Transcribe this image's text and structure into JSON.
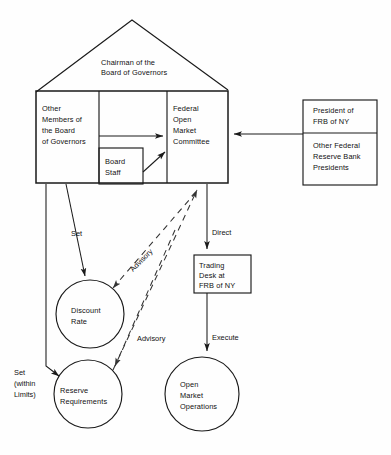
{
  "diagram": {
    "colors": {
      "stroke": "#1a1a1a",
      "dashed_stroke": "#333333",
      "background": "#fefefe",
      "text": "#111111"
    },
    "house": {
      "roof_label": {
        "line1": "Chairman of the",
        "line2": "Board of Governors"
      },
      "left_room": {
        "line1": "Other",
        "line2": "Members of",
        "line3": "the Board",
        "line4": "of Governors"
      },
      "board_staff": {
        "line1": "Board",
        "line2": "Staff"
      },
      "fomc": {
        "line1": "Federal",
        "line2": "Open",
        "line3": "Market",
        "line4": "Committee"
      }
    },
    "right_boxes": {
      "president": {
        "line1": "President of",
        "line2": "FRB of NY"
      },
      "other_presidents": {
        "line1": "Other Federal",
        "line2": "Reserve Bank",
        "line3": "Presidents"
      }
    },
    "trading_desk": {
      "line1": "Trading",
      "line2": "Desk at",
      "line3": "FRB of NY"
    },
    "circles": {
      "discount_rate": {
        "line1": "Discount",
        "line2": "Rate"
      },
      "reserve_requirements": {
        "line1": "Reserve",
        "line2": "Requirements"
      },
      "open_market_operations": {
        "line1": "Open",
        "line2": "Market",
        "line3": "Operations"
      }
    },
    "edge_labels": {
      "set": "Set",
      "set_within_limits": {
        "line1": "Set",
        "line2": "(within",
        "line3": "Limits)"
      },
      "advisory_upper": "Advisory",
      "advisory_lower": "Advisory",
      "direct": "Direct",
      "execute": "Execute"
    }
  }
}
